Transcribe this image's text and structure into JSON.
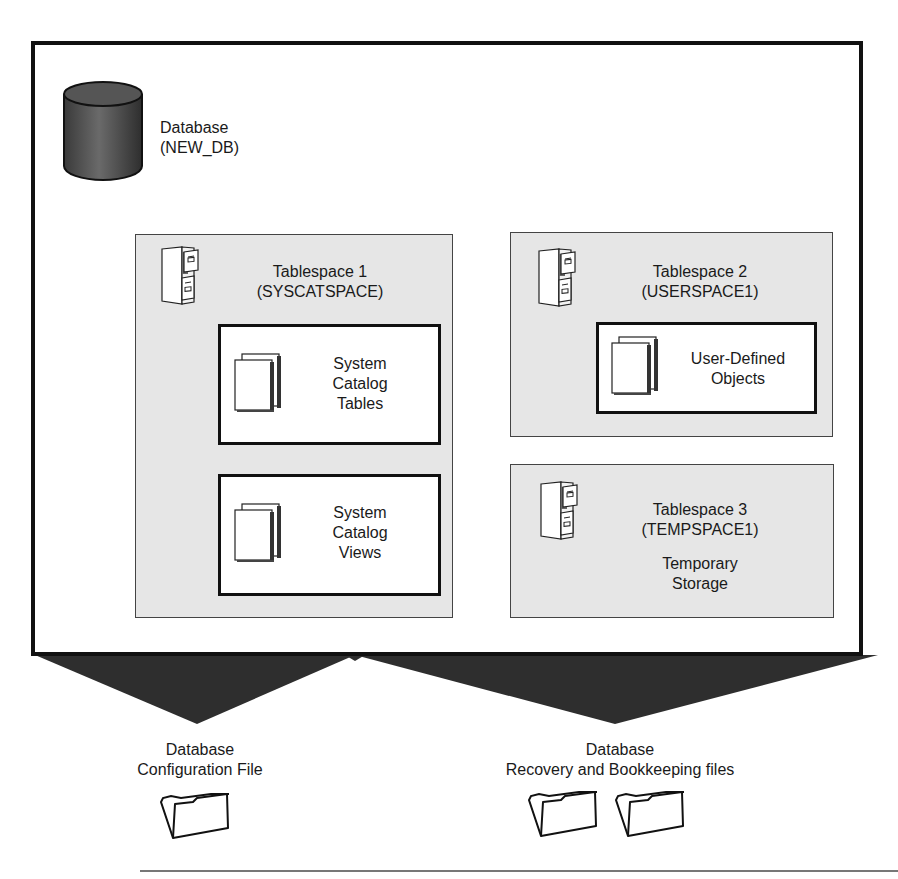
{
  "database": {
    "label_line1": "Database",
    "label_line2": "(NEW_DB)",
    "icon": "database-cylinder-icon"
  },
  "tablespaces": [
    {
      "title_line1": "Tablespace 1",
      "title_line2": "(SYSCATSPACE)",
      "icon": "file-cabinet-icon",
      "contents": [
        {
          "lines": [
            "System",
            "Catalog",
            "Tables"
          ],
          "icon": "documents-icon"
        },
        {
          "lines": [
            "System",
            "Catalog",
            "Views"
          ],
          "icon": "documents-icon"
        }
      ]
    },
    {
      "title_line1": "Tablespace 2",
      "title_line2": "(USERSPACE1)",
      "icon": "file-cabinet-icon",
      "contents": [
        {
          "lines": [
            "User-Defined",
            "Objects"
          ],
          "icon": "documents-icon"
        }
      ]
    },
    {
      "title_line1": "Tablespace 3",
      "title_line2": "(TEMPSPACE1)",
      "icon": "file-cabinet-icon",
      "description_line1": "Temporary",
      "description_line2": "Storage"
    }
  ],
  "files": [
    {
      "label_line1": "Database",
      "label_line2": "Configuration File",
      "folder_count": 1,
      "icon": "folder-icon"
    },
    {
      "label_line1": "Database",
      "label_line2": "Recovery and Bookkeeping files",
      "folder_count": 2,
      "icon": "folder-icon"
    }
  ],
  "colors": {
    "frame_border": "#111111",
    "tablespace_fill": "#e6e6e6",
    "connector_fill": "#2e2e2e",
    "cylinder_fill": "#555555"
  }
}
